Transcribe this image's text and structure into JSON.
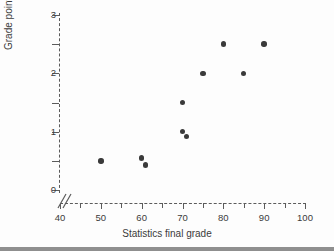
{
  "figure": {
    "kind": "scatter-plot",
    "background_color": "#fdfdfd",
    "marker_color": "#3a3a3a",
    "axis_color": "#5b5b5b",
    "text_color": "#3b3b3b",
    "axis_break_symbol": "//"
  },
  "chart_data": {
    "type": "scatter",
    "title": "",
    "xlabel": "Statistics final grade",
    "ylabel": "Grade point average",
    "xlim": [
      40,
      100
    ],
    "ylim": [
      0,
      3
    ],
    "grid": false,
    "legend": null,
    "x_major_ticks": [
      40,
      50,
      60,
      70,
      80,
      90,
      100
    ],
    "x_major_tick_labels": [
      "40",
      "50",
      "60",
      "70",
      "80",
      "90",
      "100"
    ],
    "x_minor_ticks": [
      45,
      55,
      65,
      75,
      85,
      95
    ],
    "y_major_ticks": [
      0,
      1,
      2,
      3
    ],
    "y_major_tick_labels": [
      "0",
      "1",
      "2",
      "3"
    ],
    "y_minor_ticks": [
      0.5,
      1.5,
      2.5
    ],
    "axis_break_on_x": true,
    "points": [
      {
        "x": 50,
        "y": 0.5
      },
      {
        "x": 60,
        "y": 0.55
      },
      {
        "x": 61,
        "y": 0.43
      },
      {
        "x": 70,
        "y": 1.5
      },
      {
        "x": 70,
        "y": 1.0
      },
      {
        "x": 71,
        "y": 0.92
      },
      {
        "x": 75,
        "y": 2.0
      },
      {
        "x": 80,
        "y": 2.5
      },
      {
        "x": 85,
        "y": 2.0
      },
      {
        "x": 90,
        "y": 2.5
      }
    ]
  }
}
